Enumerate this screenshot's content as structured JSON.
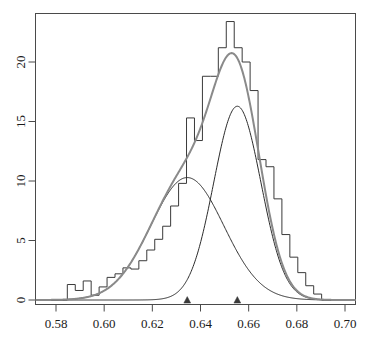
{
  "chart_data": {
    "type": "line",
    "title": "",
    "subtitle": "",
    "xlabel": "",
    "ylabel": "",
    "xlim": [
      0.5715,
      0.7045
    ],
    "ylim": [
      0,
      23.9
    ],
    "grid": false,
    "legend": "none",
    "x_ticks": [
      0.58,
      0.6,
      0.62,
      0.64,
      0.66,
      0.68,
      0.7
    ],
    "x_tick_labels": [
      "0.58",
      "0.60",
      "0.62",
      "0.64",
      "0.66",
      "0.68",
      "0.70"
    ],
    "y_ticks": [
      0,
      5,
      10,
      15,
      20
    ],
    "y_tick_labels": [
      "0",
      "5",
      "10",
      "15",
      "20"
    ],
    "histogram": {
      "name": "Histogram (density)",
      "bin_width": 0.0033,
      "bin_edges": [
        0.5814,
        0.5847,
        0.588,
        0.5913,
        0.5946,
        0.5979,
        0.6012,
        0.6045,
        0.6078,
        0.6111,
        0.6144,
        0.6177,
        0.621,
        0.6243,
        0.6276,
        0.6309,
        0.6342,
        0.6375,
        0.6408,
        0.6441,
        0.6474,
        0.6507,
        0.654,
        0.6573,
        0.6606,
        0.6639,
        0.6672,
        0.6705,
        0.6738,
        0.6771,
        0.6804,
        0.6837,
        0.687,
        0.6903
      ],
      "bin_heights": [
        0.0,
        1.3,
        0.8,
        1.6,
        0.4,
        1.1,
        1.9,
        2.2,
        2.7,
        2.6,
        3.3,
        4.2,
        5.1,
        6.2,
        7.9,
        9.8,
        15.3,
        13.4,
        18.8,
        18.8,
        21.2,
        23.4,
        21.2,
        20.0,
        17.6,
        11.8,
        11.2,
        8.5,
        5.5,
        3.6,
        2.3,
        1.2,
        0.5
      ]
    },
    "series": [
      {
        "name": "Mixture density",
        "type": "gaussian-mixture-total",
        "color": "#8a8a8a",
        "line_width": 2.0,
        "peak_x": 0.6546,
        "peak_y": 22.3
      },
      {
        "name": "Component 1",
        "type": "gaussian",
        "color": "#2b2b2b",
        "line_width": 1.0,
        "mean": 0.6345,
        "sd": 0.0152,
        "weight": 0.392,
        "peak_y": 10.3
      },
      {
        "name": "Component 2",
        "type": "gaussian",
        "color": "#2b2b2b",
        "line_width": 1.0,
        "mean": 0.6553,
        "sd": 0.0098,
        "weight": 0.4,
        "peak_y": 16.3
      }
    ],
    "markers": {
      "name": "component-mean-markers",
      "symbol": "triangle",
      "color": "#3a3a3a",
      "y": 0,
      "x_values": [
        0.6345,
        0.6553
      ]
    }
  },
  "axes": {
    "box_color": "#4a4a4a",
    "tick_color": "#4a4a4a"
  }
}
